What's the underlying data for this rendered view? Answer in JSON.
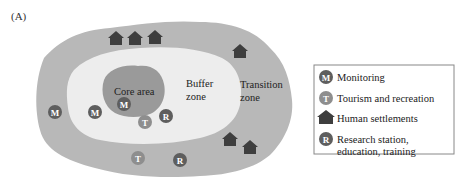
{
  "panel_label": "(A)",
  "zones": {
    "core": "Core area",
    "buffer_line1": "Buffer",
    "buffer_line2": "zone",
    "transition_line1": "Transition",
    "transition_line2": "zone"
  },
  "colors": {
    "transition_fill": "#b8b8b8",
    "buffer_fill": "#ededed",
    "core_fill": "#9a9a9a",
    "marker_dark": "#5e5e5e",
    "marker_light": "#8e8e8e",
    "settlement": "#3e3e3e"
  },
  "markers": [
    {
      "type": "M",
      "zone": "transition"
    },
    {
      "type": "M",
      "zone": "buffer"
    },
    {
      "type": "M",
      "zone": "core"
    },
    {
      "type": "T",
      "zone": "buffer"
    },
    {
      "type": "R",
      "zone": "buffer"
    },
    {
      "type": "T",
      "zone": "transition"
    },
    {
      "type": "R",
      "zone": "transition"
    }
  ],
  "settlements_count": 6,
  "legend": {
    "items": [
      {
        "symbol": "M",
        "icon": "monitoring-icon",
        "label": "Monitoring"
      },
      {
        "symbol": "T",
        "icon": "tourism-icon",
        "label": "Tourism and recreation"
      },
      {
        "symbol": "house",
        "icon": "house-icon",
        "label": "Human settlements"
      },
      {
        "symbol": "R",
        "icon": "research-icon",
        "label_line1": "Research station,",
        "label_line2": "education, training"
      }
    ]
  }
}
